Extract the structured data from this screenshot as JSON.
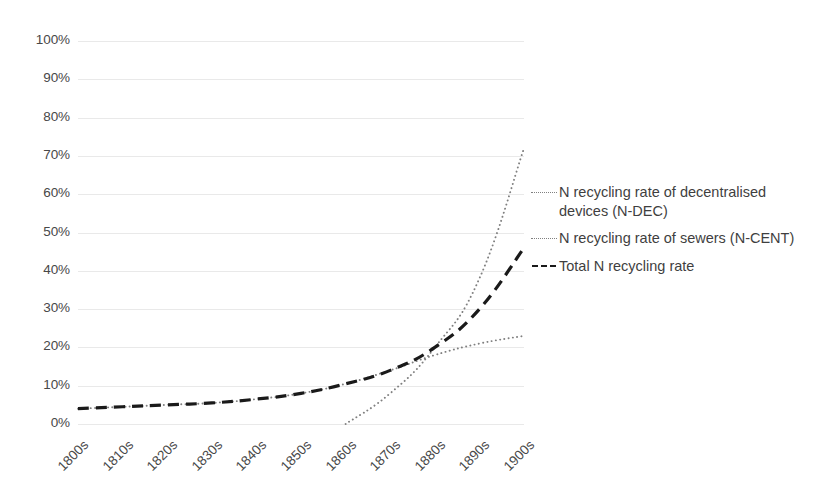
{
  "chart_data": {
    "type": "line",
    "title": "",
    "subtitle": "",
    "xlabel": "",
    "ylabel": "",
    "categories": [
      "1800s",
      "1810s",
      "1820s",
      "1830s",
      "1840s",
      "1850s",
      "1860s",
      "1870s",
      "1880s",
      "1890s",
      "1900s"
    ],
    "ylim": [
      0,
      100
    ],
    "ytick_labels": [
      "100%",
      "90%",
      "80%",
      "70%",
      "60%",
      "50%",
      "40%",
      "30%",
      "20%",
      "10%",
      "0%"
    ],
    "ytick_values": [
      100,
      90,
      80,
      70,
      60,
      50,
      40,
      30,
      20,
      10,
      0
    ],
    "ytick_suffix": "%",
    "grid": true,
    "grid_axis": "y",
    "grid_color": "#e9e9e9",
    "legend_position": "right",
    "series": [
      {
        "name": "N recycling rate of decentralised devices (N-DEC)",
        "style": "dotted",
        "color": "#808080",
        "values": [
          4,
          4.5,
          5,
          5.5,
          6.5,
          8,
          10.5,
          14,
          18,
          21,
          23
        ]
      },
      {
        "name": "N recycling rate of sewers (N-CENT)",
        "style": "dotted",
        "color": "#808080",
        "values": [
          null,
          null,
          null,
          null,
          null,
          null,
          0,
          8,
          20,
          38,
          72
        ]
      },
      {
        "name": "Total N recycling rate",
        "style": "dashed",
        "color": "#1a1a1a",
        "values": [
          4,
          4.5,
          5,
          5.5,
          6.5,
          8,
          10.5,
          14,
          20,
          30,
          46
        ]
      }
    ]
  },
  "legend": {
    "entries": [
      {
        "label": "N recycling rate of decentralised devices (N-DEC)",
        "marker": "dotted-line-icon"
      },
      {
        "label": "N recycling rate of sewers (N-CENT)",
        "marker": "dotted-line-icon"
      },
      {
        "label": "Total N recycling rate",
        "marker": "dashed-line-icon"
      }
    ]
  },
  "axes": {
    "y": {
      "labels": [
        "100%",
        "90%",
        "80%",
        "70%",
        "60%",
        "50%",
        "40%",
        "30%",
        "20%",
        "10%",
        "0%"
      ]
    },
    "x": {
      "labels": [
        "1800s",
        "1810s",
        "1820s",
        "1830s",
        "1840s",
        "1850s",
        "1860s",
        "1870s",
        "1880s",
        "1890s",
        "1900s"
      ]
    }
  },
  "colors": {
    "background": "#ffffff",
    "gridline": "#e9e9e9",
    "axis_text": "#484848",
    "series_light": "#808080",
    "series_dark": "#1a1a1a"
  }
}
